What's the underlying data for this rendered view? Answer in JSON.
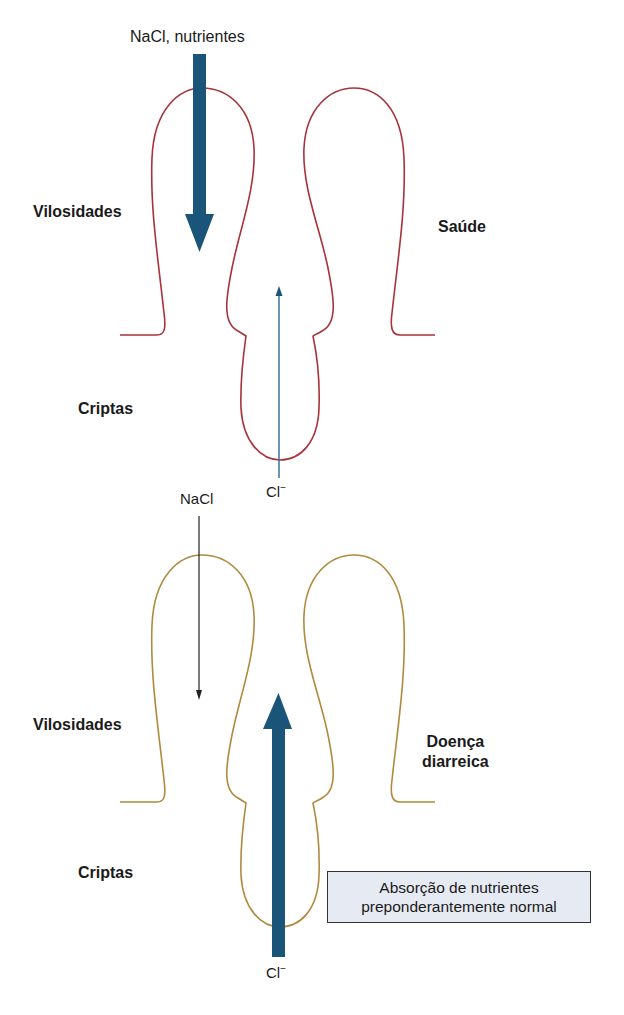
{
  "colors": {
    "healthy_outline": "#a8333a",
    "disease_outline": "#b08a3e",
    "arrow": "#1a5479",
    "note_bg": "#e6ebf3"
  },
  "panels": [
    {
      "state_label": "Saúde",
      "villi_label": "Vilosidades",
      "crypts_label": "Criptas",
      "absorption_label": "NaCl, nutrientes",
      "absorption_arrow": "thick-down",
      "secretion_ion": "Cl",
      "secretion_charge": "−",
      "secretion_arrow": "thin-up"
    },
    {
      "state_label_line1": "Doença",
      "state_label_line2": "diarreica",
      "villi_label": "Vilosidades",
      "crypts_label": "Criptas",
      "absorption_label": "NaCl",
      "absorption_arrow": "thin-down",
      "secretion_ion": "Cl",
      "secretion_charge": "−",
      "secretion_arrow": "thick-up"
    }
  ],
  "note": {
    "line1": "Absorção de nutrientes",
    "line2": "preponderantemente normal"
  }
}
